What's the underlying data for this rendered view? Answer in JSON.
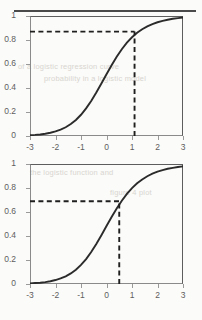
{
  "page": {
    "divider": "horizontal-rule",
    "bleed_text": [
      "of a logistic regression curve",
      "probability in a logistic model",
      "the logistic function and",
      "figure 4 plot"
    ]
  },
  "chart_data": [
    {
      "id": "top",
      "type": "line",
      "title": "",
      "xlabel": "",
      "ylabel": "",
      "xlim": [
        -3,
        3
      ],
      "ylim": [
        0,
        1
      ],
      "grid": false,
      "legend": null,
      "xticks": [
        "-3",
        "-2",
        "-1",
        "0",
        "1",
        "2",
        "3"
      ],
      "xtick_values": [
        -3,
        -2,
        -1,
        0,
        1,
        2,
        3
      ],
      "yticks": [
        "0",
        "0.2",
        "0.4",
        "0.6",
        "0.8",
        "1"
      ],
      "ytick_values": [
        0,
        0.2,
        0.4,
        0.6,
        0.8,
        1
      ],
      "series": [
        {
          "name": "logistic curve",
          "color": "#2b2b2b",
          "x": [
            -3,
            -2.8,
            -2.6,
            -2.4,
            -2.2,
            -2,
            -1.8,
            -1.6,
            -1.4,
            -1.2,
            -1,
            -0.8,
            -0.6,
            -0.4,
            -0.2,
            0,
            0.2,
            0.4,
            0.6,
            0.8,
            1,
            1.2,
            1.4,
            1.6,
            1.8,
            2,
            2.2,
            2.4,
            2.6,
            2.8,
            3
          ],
          "y": [
            0.006,
            0.009,
            0.013,
            0.019,
            0.027,
            0.038,
            0.053,
            0.073,
            0.1,
            0.134,
            0.177,
            0.23,
            0.292,
            0.362,
            0.437,
            0.514,
            0.589,
            0.66,
            0.723,
            0.778,
            0.823,
            0.86,
            0.89,
            0.914,
            0.933,
            0.948,
            0.96,
            0.969,
            0.977,
            0.982,
            0.987
          ]
        }
      ],
      "annotations": [
        {
          "name": "reference-lines",
          "style": "dashed",
          "color": "#1f1f1f",
          "x_value": 1.1,
          "y_value": 0.87,
          "horizontal_from_x": -3,
          "vertical_from_y": 0
        }
      ]
    },
    {
      "id": "bottom",
      "type": "line",
      "title": "",
      "xlabel": "",
      "ylabel": "",
      "xlim": [
        -3,
        3
      ],
      "ylim": [
        0,
        1
      ],
      "grid": false,
      "legend": null,
      "xticks": [
        "-3",
        "-2",
        "-1",
        "0",
        "1",
        "2",
        "3"
      ],
      "xtick_values": [
        -3,
        -2,
        -1,
        0,
        1,
        2,
        3
      ],
      "yticks": [
        "0",
        "0.2",
        "0.4",
        "0.6",
        "0.8",
        "1"
      ],
      "ytick_values": [
        0,
        0.2,
        0.4,
        0.6,
        0.8,
        1
      ],
      "series": [
        {
          "name": "logistic curve",
          "color": "#2b2b2b",
          "x": [
            -3,
            -2.8,
            -2.6,
            -2.4,
            -2.2,
            -2,
            -1.8,
            -1.6,
            -1.4,
            -1.2,
            -1,
            -0.8,
            -0.6,
            -0.4,
            -0.2,
            0,
            0.2,
            0.4,
            0.6,
            0.8,
            1,
            1.2,
            1.4,
            1.6,
            1.8,
            2,
            2.2,
            2.4,
            2.6,
            2.8,
            3
          ],
          "y": [
            0.005,
            0.008,
            0.011,
            0.016,
            0.023,
            0.033,
            0.046,
            0.064,
            0.088,
            0.119,
            0.159,
            0.208,
            0.267,
            0.334,
            0.407,
            0.483,
            0.558,
            0.629,
            0.694,
            0.751,
            0.799,
            0.839,
            0.871,
            0.898,
            0.919,
            0.936,
            0.949,
            0.96,
            0.968,
            0.975,
            0.98
          ]
        }
      ],
      "annotations": [
        {
          "name": "reference-lines",
          "style": "dashed",
          "color": "#1f1f1f",
          "x_value": 0.5,
          "y_value": 0.69,
          "horizontal_from_x": -3,
          "vertical_from_y": 0
        }
      ]
    }
  ]
}
